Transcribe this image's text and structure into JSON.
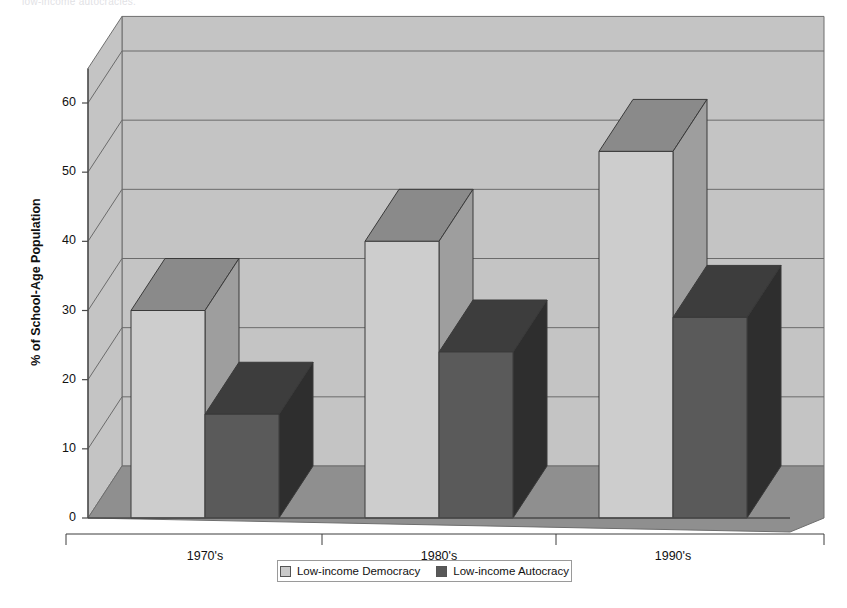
{
  "page": {
    "cutoff_top_text": "low-income autocracies."
  },
  "chart_data": {
    "type": "bar",
    "title": "Median Levels of Secondary School Enrollment",
    "xlabel": "",
    "ylabel": "% of School-Age Population",
    "categories": [
      "1970's",
      "1980's",
      "1990's"
    ],
    "series": [
      {
        "name": "Low-income Democracy",
        "values": [
          30,
          40,
          53
        ],
        "color": "#c9c9c9"
      },
      {
        "name": "Low-income Autocracy",
        "values": [
          15,
          24,
          29
        ],
        "color": "#585858"
      }
    ],
    "ylim": [
      0,
      65
    ],
    "yticks": [
      0,
      10,
      20,
      30,
      40,
      50,
      60
    ],
    "ytick_labels": [
      "0",
      "10",
      "20",
      "30",
      "40",
      "50",
      "60"
    ],
    "grid": true,
    "legend_position": "bottom",
    "style": "3d-bar",
    "colors": {
      "wall": "#c4c4c4",
      "floor": "#8f8f8f",
      "light_bar_front": "#cdcdcd",
      "light_bar_top": "#8a8a8a",
      "light_bar_side": "#9e9e9e",
      "dark_bar_front": "#5a5a5a",
      "dark_bar_top": "#3d3d3d",
      "dark_bar_side": "#2e2e2e",
      "gridline": "#6b6b6b",
      "axis": "#4a4a4a"
    }
  }
}
